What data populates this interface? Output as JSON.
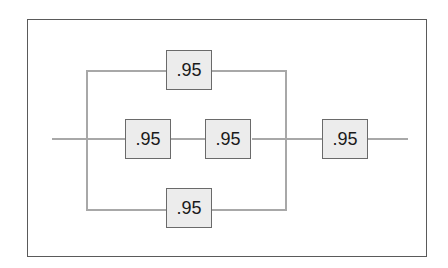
{
  "diagram": {
    "type": "reliability-block-diagram",
    "blocks": [
      {
        "id": "top-parallel",
        "label": ".95"
      },
      {
        "id": "middle-series-1",
        "label": ".95"
      },
      {
        "id": "middle-series-2",
        "label": ".95"
      },
      {
        "id": "bottom-parallel",
        "label": ".95"
      },
      {
        "id": "output-series",
        "label": ".95"
      }
    ],
    "colors": {
      "line": "#a8a8a8",
      "block_fill": "#ececec",
      "block_border": "#6a6a6a",
      "frame": "#5a5a5a"
    }
  }
}
